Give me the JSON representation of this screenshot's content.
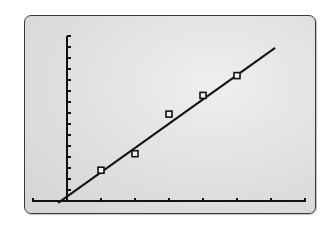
{
  "chart_data": {
    "type": "scatter",
    "title": "",
    "xlabel": "",
    "ylabel": "",
    "grid": false,
    "legend": null,
    "axis_ranges": {
      "xlim": [
        -1,
        7
      ],
      "ylim": [
        0,
        15
      ]
    },
    "x_ticks": [
      -1,
      0,
      1,
      2,
      3,
      4,
      5,
      6,
      7
    ],
    "y_ticks": [
      0,
      1,
      2,
      3,
      4,
      5,
      6,
      7,
      8,
      9,
      10,
      11,
      12,
      13,
      14,
      15
    ],
    "series": [
      {
        "name": "data points",
        "marker": "hollow-square",
        "x": [
          1,
          2,
          3,
          4,
          5
        ],
        "y": [
          2.8,
          4.3,
          7.9,
          9.6,
          11.4
        ]
      },
      {
        "name": "regression line",
        "kind": "line",
        "slope": 2.21,
        "intercept": 0.4,
        "x_range": [
          -0.26,
          6.12
        ]
      }
    ]
  },
  "screen": {
    "background": "#e2e2e2",
    "ink_color": "#111111",
    "border_color": "#3a3a3a"
  }
}
